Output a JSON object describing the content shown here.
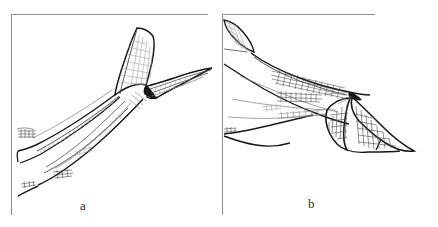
{
  "figure": {
    "kind": "scientific-line-drawing",
    "background_color": "#ffffff",
    "ink_color": "#18181a",
    "frame_color": "#8e8e96",
    "panels": [
      {
        "id": "a",
        "label": "a",
        "label_x": 85,
        "label_y": 208,
        "frame": {
          "x": 11,
          "y": 14,
          "width": 197,
          "height": 201,
          "sides": "top-left"
        },
        "description": "caudal peduncle rising to the right with tail fin spread, upper lobe hatched with cross-hatch net pattern, lower lobe sweeping right"
      },
      {
        "id": "b",
        "label": "b",
        "label_x": 313,
        "label_y": 205,
        "frame": {
          "x": 222,
          "y": 14,
          "width": 153,
          "height": 201,
          "sides": "top-left"
        },
        "description": "caudal peduncle running to the right with forked tail fin angled downward, body carrying rows of short hatch strokes"
      }
    ],
    "labels": {
      "a": "a",
      "b": "b"
    }
  }
}
